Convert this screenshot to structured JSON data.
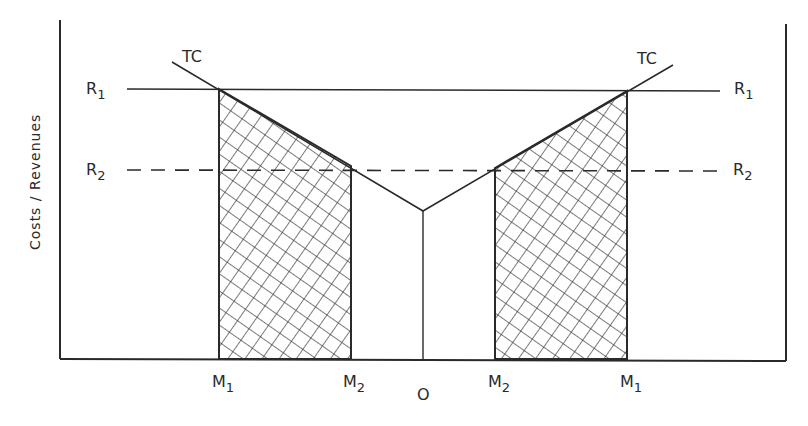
{
  "diagram": {
    "y_axis_label": "Costs / Revenues",
    "curve_label_left": "TC",
    "curve_label_right": "TC",
    "revenue_lines": [
      {
        "name": "R",
        "sub": "1",
        "style": "solid"
      },
      {
        "name": "R",
        "sub": "2",
        "style": "dashed"
      }
    ],
    "x_labels": {
      "left_m1": {
        "name": "M",
        "sub": "1"
      },
      "left_m2": {
        "name": "M",
        "sub": "2"
      },
      "origin": "O",
      "right_m2": {
        "name": "M",
        "sub": "2"
      },
      "right_m1": {
        "name": "M",
        "sub": "1"
      }
    },
    "colors": {
      "line": "#2a2a2a",
      "background": "#ffffff"
    }
  }
}
